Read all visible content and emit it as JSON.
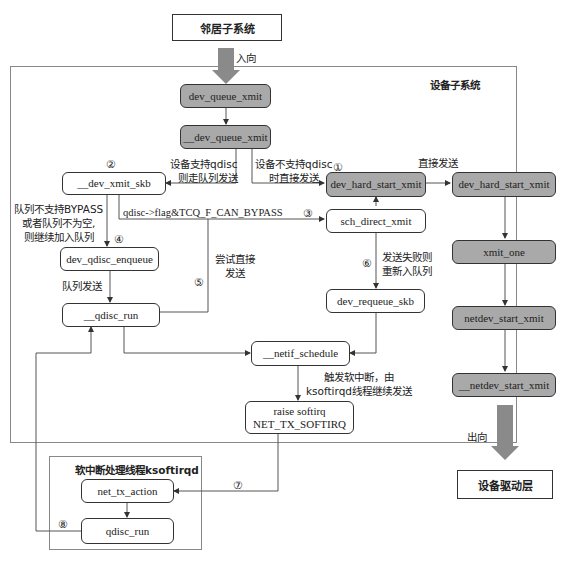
{
  "top_box": {
    "label": "邻居子系统"
  },
  "bottom_box": {
    "label": "设备驱动层"
  },
  "device_frame": {
    "title": "设备子系统"
  },
  "softirq_frame": {
    "title": "软中断处理线程ksoftirqd"
  },
  "arrows": {
    "in_label": "入向",
    "out_label": "出向"
  },
  "nodes": {
    "dev_queue_xmit": "dev_queue_xmit",
    "__dev_queue_xmit": "__dev_queue_xmit",
    "__dev_xmit_skb": "__dev_xmit_skb",
    "dev_hard_start_xmit_1": "dev_hard_start_xmit",
    "dev_hard_start_xmit_2": "dev_hard_start_xmit",
    "sch_direct_xmit": "sch_direct_xmit",
    "dev_qdisc_enqueue": "dev_qdisc_enqueue",
    "__qdisc_run": "__qdisc_run",
    "dev_requeue_skb": "dev_requeue_skb",
    "__netif_schedule": "__netif_schedule",
    "raise_softirq_line1": "raise softirq",
    "raise_softirq_line2": "NET_TX_SOFTIRQ",
    "xmit_one": "xmit_one",
    "netdev_start_xmit": "netdev_start_xmit",
    "__netdev_start_xmit": "__netdev_start_xmit",
    "net_tx_action": "net_tx_action",
    "qdisc_run": "qdisc_run"
  },
  "annotations": {
    "support_qdisc_l1": "设备支持qdisc",
    "support_qdisc_l2": "则走队列发送",
    "no_qdisc_l1": "设备不支持qdisc",
    "no_qdisc_l2": "时直接发送",
    "direct_send": "直接发送",
    "bypass_flag": "qdisc->flag&TCQ_F_CAN_BYPASS",
    "no_bypass_l1": "队列不支持BYPASS",
    "no_bypass_l2": "或者队列不为空,",
    "no_bypass_l3": "则继续加入队列",
    "queue_send": "队列发送",
    "try_direct_l1": "尝试直接",
    "try_direct_l2": "发送",
    "fail_requeue_l1": "发送失败则",
    "fail_requeue_l2": "重新入队列",
    "softirq_l1": "触发软中断，由",
    "softirq_l2": "ksoftirqd线程继续发送"
  },
  "steps": {
    "s1": "①",
    "s2": "②",
    "s3": "③",
    "s4": "④",
    "s5": "⑤",
    "s6": "⑥",
    "s7": "⑦",
    "s8": "⑧"
  },
  "colors": {
    "gray_node": "#a9a9a9",
    "big_arrow": "#8a8a8a",
    "line": "#555555"
  }
}
